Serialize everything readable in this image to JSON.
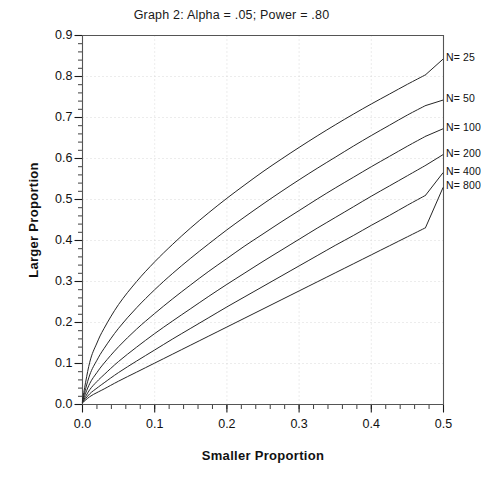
{
  "chart_data": {
    "type": "line",
    "title": "Graph 2:  Alpha = .05; Power = .80",
    "xlabel": "Smaller Proportion",
    "ylabel": "Larger Proportion",
    "xlim": [
      0.0,
      0.5
    ],
    "ylim": [
      0.0,
      0.9
    ],
    "xticks": [
      "0.0",
      "0.1",
      "0.2",
      "0.3",
      "0.4",
      "0.5"
    ],
    "xtick_values": [
      0.0,
      0.1,
      0.2,
      0.3,
      0.4,
      0.5
    ],
    "yticks": [
      "0.0",
      "0.1",
      "0.2",
      "0.3",
      "0.4",
      "0.5",
      "0.6",
      "0.7",
      "0.8",
      "0.9"
    ],
    "ytick_values": [
      0.0,
      0.1,
      0.2,
      0.3,
      0.4,
      0.5,
      0.6,
      0.7,
      0.8,
      0.9
    ],
    "minor_ticks_x": 0.02,
    "minor_ticks_y": 0.02,
    "grid": "dotted-faint-major",
    "legend_position": "inline-right-end-of-curve",
    "line_color": "#262626",
    "line_width": 1.0,
    "series": [
      {
        "name": "N= 25",
        "label": "N= 25",
        "x": [
          0.0,
          0.01,
          0.02,
          0.03,
          0.05,
          0.075,
          0.1,
          0.125,
          0.15,
          0.175,
          0.2,
          0.225,
          0.25,
          0.275,
          0.3,
          0.325,
          0.35,
          0.375,
          0.4,
          0.425,
          0.45,
          0.475,
          0.5
        ],
        "y": [
          0.012,
          0.103,
          0.15,
          0.186,
          0.244,
          0.3,
          0.348,
          0.391,
          0.431,
          0.468,
          0.503,
          0.536,
          0.568,
          0.598,
          0.627,
          0.655,
          0.682,
          0.708,
          0.733,
          0.757,
          0.781,
          0.804,
          0.84
        ],
        "label_x": 0.505,
        "label_y": 0.845
      },
      {
        "name": "N= 50",
        "label": "N= 50",
        "x": [
          0.0,
          0.01,
          0.02,
          0.03,
          0.05,
          0.075,
          0.1,
          0.125,
          0.15,
          0.175,
          0.2,
          0.225,
          0.25,
          0.275,
          0.3,
          0.325,
          0.35,
          0.375,
          0.4,
          0.425,
          0.45,
          0.475,
          0.5
        ],
        "y": [
          0.01,
          0.072,
          0.108,
          0.137,
          0.186,
          0.236,
          0.28,
          0.32,
          0.357,
          0.392,
          0.426,
          0.458,
          0.489,
          0.519,
          0.548,
          0.576,
          0.603,
          0.63,
          0.656,
          0.681,
          0.706,
          0.729,
          0.743
        ],
        "label_x": 0.505,
        "label_y": 0.745
      },
      {
        "name": "N= 100",
        "label": "N= 100",
        "x": [
          0.0,
          0.01,
          0.02,
          0.03,
          0.05,
          0.075,
          0.1,
          0.125,
          0.15,
          0.175,
          0.2,
          0.225,
          0.25,
          0.275,
          0.3,
          0.325,
          0.35,
          0.375,
          0.4,
          0.425,
          0.45,
          0.475,
          0.5
        ],
        "y": [
          0.008,
          0.051,
          0.078,
          0.101,
          0.141,
          0.184,
          0.222,
          0.258,
          0.292,
          0.325,
          0.356,
          0.387,
          0.416,
          0.445,
          0.473,
          0.501,
          0.528,
          0.554,
          0.58,
          0.605,
          0.63,
          0.654,
          0.672
        ],
        "label_x": 0.505,
        "label_y": 0.675
      },
      {
        "name": "N= 200",
        "label": "N= 200",
        "x": [
          0.0,
          0.01,
          0.02,
          0.03,
          0.05,
          0.075,
          0.1,
          0.125,
          0.15,
          0.175,
          0.2,
          0.225,
          0.25,
          0.275,
          0.3,
          0.325,
          0.35,
          0.375,
          0.4,
          0.425,
          0.45,
          0.475,
          0.5
        ],
        "y": [
          0.006,
          0.036,
          0.056,
          0.073,
          0.105,
          0.14,
          0.173,
          0.204,
          0.234,
          0.264,
          0.293,
          0.321,
          0.349,
          0.376,
          0.403,
          0.43,
          0.456,
          0.482,
          0.508,
          0.533,
          0.558,
          0.583,
          0.61
        ],
        "label_x": 0.505,
        "label_y": 0.612
      },
      {
        "name": "N= 400",
        "label": "N= 400",
        "x": [
          0.0,
          0.01,
          0.02,
          0.03,
          0.05,
          0.075,
          0.1,
          0.125,
          0.15,
          0.175,
          0.2,
          0.225,
          0.25,
          0.275,
          0.3,
          0.325,
          0.35,
          0.375,
          0.4,
          0.425,
          0.45,
          0.475,
          0.5
        ],
        "y": [
          0.005,
          0.026,
          0.04,
          0.053,
          0.078,
          0.106,
          0.133,
          0.16,
          0.186,
          0.212,
          0.238,
          0.263,
          0.288,
          0.313,
          0.338,
          0.363,
          0.388,
          0.412,
          0.437,
          0.461,
          0.486,
          0.51,
          0.565
        ],
        "label_x": 0.505,
        "label_y": 0.568
      },
      {
        "name": "N= 800",
        "label": "N= 800",
        "x": [
          0.0,
          0.01,
          0.02,
          0.03,
          0.05,
          0.075,
          0.1,
          0.125,
          0.15,
          0.175,
          0.2,
          0.225,
          0.25,
          0.275,
          0.3,
          0.325,
          0.35,
          0.375,
          0.4,
          0.425,
          0.45,
          0.475,
          0.5
        ],
        "y": [
          0.004,
          0.019,
          0.029,
          0.038,
          0.057,
          0.079,
          0.101,
          0.123,
          0.145,
          0.167,
          0.189,
          0.211,
          0.233,
          0.255,
          0.277,
          0.299,
          0.321,
          0.343,
          0.365,
          0.387,
          0.409,
          0.431,
          0.53
        ],
        "label_x": 0.505,
        "label_y": 0.532
      }
    ]
  }
}
